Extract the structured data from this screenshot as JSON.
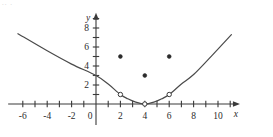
{
  "figure": {
    "width": 273,
    "height": 137,
    "background_color": "#ffffff",
    "ink_color": "#3a3a3a"
  },
  "corner_artifact": {
    "text": ".. .",
    "note_visible": true
  },
  "chart_data": {
    "type": "line",
    "title": "",
    "subtitle": "",
    "xlabel": "x",
    "ylabel": "y",
    "xlim": [
      -7.2,
      11.8
    ],
    "ylim": [
      -2.2,
      9.6
    ],
    "grid": false,
    "legend": null,
    "x_tick_values": [
      -6,
      -5,
      -4,
      -3,
      -2,
      -1,
      0,
      1,
      2,
      3,
      4,
      5,
      6,
      7,
      8,
      9,
      10,
      11
    ],
    "x_tick_labels": [
      "-6",
      "",
      "-4",
      "",
      "-2",
      "",
      "0",
      "",
      "2",
      "",
      "4",
      "",
      "6",
      "",
      "8",
      "",
      "10",
      ""
    ],
    "x_labeled_ticks": [
      {
        "value": -6,
        "label": "-6"
      },
      {
        "value": -4,
        "label": "-4"
      },
      {
        "value": -2,
        "label": "-2"
      },
      {
        "value": 0,
        "label": "0"
      },
      {
        "value": 2,
        "label": "2"
      },
      {
        "value": 4,
        "label": "4"
      },
      {
        "value": 6,
        "label": "6"
      },
      {
        "value": 8,
        "label": "8"
      },
      {
        "value": 10,
        "label": "10"
      }
    ],
    "y_tick_values": [
      1,
      2,
      3,
      4,
      5,
      6,
      7,
      8,
      9
    ],
    "y_labeled_ticks": [
      {
        "value": 2,
        "label": "2"
      },
      {
        "value": 4,
        "label": "4"
      },
      {
        "value": 6,
        "label": "6"
      },
      {
        "value": 8,
        "label": "8"
      }
    ],
    "series": [
      {
        "name": "piecewise-curve",
        "style": "solid",
        "points": [
          {
            "x": -6.4,
            "y": 7.4
          },
          {
            "x": -4,
            "y": 5.6
          },
          {
            "x": -2,
            "y": 4.2
          },
          {
            "x": 0,
            "y": 3.0
          },
          {
            "x": 1.0,
            "y": 2.1
          },
          {
            "x": 2,
            "y": 1.0
          },
          {
            "x": 2.6,
            "y": 0.55
          },
          {
            "x": 3.2,
            "y": 0.22
          },
          {
            "x": 4,
            "y": 0.0
          },
          {
            "x": 4.8,
            "y": 0.22
          },
          {
            "x": 5.4,
            "y": 0.55
          },
          {
            "x": 6,
            "y": 1.0
          },
          {
            "x": 7.0,
            "y": 2.1
          },
          {
            "x": 8,
            "y": 3.1
          },
          {
            "x": 9.5,
            "y": 5.1
          },
          {
            "x": 11.1,
            "y": 7.3
          }
        ]
      }
    ],
    "open_points": [
      {
        "x": 2,
        "y": 1
      },
      {
        "x": 4,
        "y": 0
      },
      {
        "x": 6,
        "y": 1
      }
    ],
    "solid_points": [
      {
        "x": 2,
        "y": 5
      },
      {
        "x": 4,
        "y": 3
      },
      {
        "x": 6,
        "y": 5
      }
    ],
    "axis_arrows": [
      "x-positive",
      "y-positive"
    ]
  }
}
